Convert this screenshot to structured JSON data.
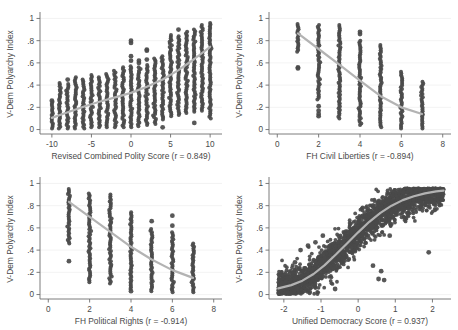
{
  "figure": {
    "title": "",
    "background": "#ffffff",
    "point_color": "#4a4a4a",
    "line_color": "#b3b3b3",
    "axis_color": "#6e6e6e",
    "grid_color": "#f0f0f0",
    "panel_count": 4
  },
  "chart_data": [
    {
      "type": "scatter",
      "panel": "top-left",
      "title": "",
      "xlabel": "Revised Combined Polity Score (r = 0.849)",
      "ylabel": "V-Dem Polyarchy Index",
      "correlation": 0.849,
      "xvar": "Revised Combined Polity Score",
      "yvar": "V-Dem Polyarchy Index",
      "xlim": [
        -11.5,
        11.5
      ],
      "ylim": [
        -0.04,
        1.04
      ],
      "xticks": [
        -10,
        -5,
        0,
        5,
        10
      ],
      "xticklabels": [
        "-10",
        "-5",
        "0",
        "5",
        "10"
      ],
      "yticks": [
        0,
        0.2,
        0.4,
        0.6,
        0.8,
        1
      ],
      "yticklabels": [
        "0",
        ".2",
        ".4",
        ".6",
        ".8",
        "1"
      ],
      "grid": "horizontal",
      "legend": "none",
      "columns": [
        {
          "x": -10,
          "ymin": 0.01,
          "ymax": 0.25,
          "n": 140,
          "outliers": [
            0.26
          ]
        },
        {
          "x": -9,
          "ymin": 0.01,
          "ymax": 0.42,
          "n": 110,
          "outliers": []
        },
        {
          "x": -8,
          "ymin": 0.01,
          "ymax": 0.41,
          "n": 120,
          "outliers": [
            0.45
          ]
        },
        {
          "x": -7,
          "ymin": 0.01,
          "ymax": 0.47,
          "n": 120,
          "outliers": []
        },
        {
          "x": -6,
          "ymin": 0.01,
          "ymax": 0.45,
          "n": 110,
          "outliers": []
        },
        {
          "x": -5,
          "ymin": 0.02,
          "ymax": 0.49,
          "n": 130,
          "outliers": []
        },
        {
          "x": -4,
          "ymin": 0.02,
          "ymax": 0.47,
          "n": 120,
          "outliers": []
        },
        {
          "x": -3,
          "ymin": 0.02,
          "ymax": 0.5,
          "n": 120,
          "outliers": []
        },
        {
          "x": -2,
          "ymin": 0.02,
          "ymax": 0.53,
          "n": 125,
          "outliers": []
        },
        {
          "x": -1,
          "ymin": 0.02,
          "ymax": 0.56,
          "n": 125,
          "outliers": []
        },
        {
          "x": 0,
          "ymin": 0.02,
          "ymax": 0.57,
          "n": 130,
          "outliers": [
            0.62,
            0.66,
            0.78,
            0.8
          ]
        },
        {
          "x": 1,
          "ymin": 0.03,
          "ymax": 0.56,
          "n": 130,
          "outliers": [
            0.6,
            0.62
          ]
        },
        {
          "x": 2,
          "ymin": 0.04,
          "ymax": 0.58,
          "n": 130,
          "outliers": [
            0.63,
            0.71,
            0.72
          ]
        },
        {
          "x": 3,
          "ymin": 0.05,
          "ymax": 0.64,
          "n": 130,
          "outliers": []
        },
        {
          "x": 4,
          "ymin": 0.09,
          "ymax": 0.66,
          "n": 125,
          "outliers": [
            0.02
          ]
        },
        {
          "x": 5,
          "ymin": 0.12,
          "ymax": 0.85,
          "n": 140,
          "outliers": []
        },
        {
          "x": 6,
          "ymin": 0.13,
          "ymax": 0.84,
          "n": 140,
          "outliers": [
            0.9
          ]
        },
        {
          "x": 7,
          "ymin": 0.15,
          "ymax": 0.88,
          "n": 140,
          "outliers": []
        },
        {
          "x": 8,
          "ymin": 0.16,
          "ymax": 0.9,
          "n": 145,
          "outliers": [
            0.06
          ]
        },
        {
          "x": 9,
          "ymin": 0.17,
          "ymax": 0.94,
          "n": 145,
          "outliers": []
        },
        {
          "x": 10,
          "ymin": 0.1,
          "ymax": 0.96,
          "n": 150,
          "outliers": []
        }
      ],
      "fit_line": [
        {
          "x": -10,
          "y": 0.105
        },
        {
          "x": -8,
          "y": 0.155
        },
        {
          "x": -6,
          "y": 0.205
        },
        {
          "x": -4,
          "y": 0.25
        },
        {
          "x": -2,
          "y": 0.29
        },
        {
          "x": 0,
          "y": 0.33
        },
        {
          "x": 2,
          "y": 0.385
        },
        {
          "x": 4,
          "y": 0.45
        },
        {
          "x": 6,
          "y": 0.535
        },
        {
          "x": 8,
          "y": 0.635
        },
        {
          "x": 10,
          "y": 0.745
        }
      ]
    },
    {
      "type": "scatter",
      "panel": "top-right",
      "title": "",
      "xlabel": "FH Civil Liberties (r = -0.894)",
      "ylabel": "V-Dem Polyarchy Index",
      "correlation": -0.894,
      "xvar": "FH Civil Liberties",
      "yvar": "V-Dem Polyarchy Index",
      "xlim": [
        -0.4,
        8.4
      ],
      "ylim": [
        -0.04,
        1.04
      ],
      "xticks": [
        0,
        2,
        4,
        6,
        8
      ],
      "xticklabels": [
        "0",
        "2",
        "4",
        "6",
        "8"
      ],
      "yticks": [
        0,
        0.2,
        0.4,
        0.6,
        0.8,
        1
      ],
      "yticklabels": [
        "0",
        ".2",
        ".4",
        ".6",
        ".8",
        "1"
      ],
      "grid": "horizontal",
      "legend": "none",
      "columns": [
        {
          "x": 1,
          "ymin": 0.7,
          "ymax": 0.95,
          "n": 170,
          "outliers": [
            0.55,
            0.56
          ]
        },
        {
          "x": 2,
          "ymin": 0.27,
          "ymax": 0.94,
          "n": 230,
          "outliers": [
            0.12,
            0.14,
            0.17,
            0.21
          ]
        },
        {
          "x": 3,
          "ymin": 0.1,
          "ymax": 0.94,
          "n": 230,
          "outliers": []
        },
        {
          "x": 4,
          "ymin": 0.04,
          "ymax": 0.8,
          "n": 230,
          "outliers": [
            0.86,
            0.88
          ]
        },
        {
          "x": 5,
          "ymin": 0.02,
          "ymax": 0.76,
          "n": 220,
          "outliers": []
        },
        {
          "x": 6,
          "ymin": 0.01,
          "ymax": 0.52,
          "n": 200,
          "outliers": []
        },
        {
          "x": 7,
          "ymin": 0.01,
          "ymax": 0.43,
          "n": 160,
          "outliers": []
        }
      ],
      "fit_line": [
        {
          "x": 1,
          "y": 0.865
        },
        {
          "x": 2,
          "y": 0.725
        },
        {
          "x": 3,
          "y": 0.585
        },
        {
          "x": 4,
          "y": 0.44
        },
        {
          "x": 5,
          "y": 0.3
        },
        {
          "x": 6,
          "y": 0.2
        },
        {
          "x": 7,
          "y": 0.14
        }
      ]
    },
    {
      "type": "scatter",
      "panel": "bottom-left",
      "title": "",
      "xlabel": "FH Political Rights (r = -0.914)",
      "ylabel": "V-Dem Polyarchy Index",
      "correlation": -0.914,
      "xvar": "FH Political Rights",
      "yvar": "V-Dem Polyarchy Index",
      "xlim": [
        -0.4,
        8.4
      ],
      "ylim": [
        -0.04,
        1.04
      ],
      "xticks": [
        0,
        2,
        4,
        6,
        8
      ],
      "xticklabels": [
        "0",
        "2",
        "4",
        "6",
        "8"
      ],
      "yticks": [
        0,
        0.2,
        0.4,
        0.6,
        0.8,
        1
      ],
      "yticklabels": [
        "0",
        ".2",
        ".4",
        ".6",
        ".8",
        "1"
      ],
      "grid": "horizontal",
      "legend": "none",
      "columns": [
        {
          "x": 1,
          "ymin": 0.46,
          "ymax": 0.95,
          "n": 210,
          "outliers": [
            0.3
          ]
        },
        {
          "x": 2,
          "ymin": 0.11,
          "ymax": 0.91,
          "n": 230,
          "outliers": []
        },
        {
          "x": 3,
          "ymin": 0.1,
          "ymax": 0.9,
          "n": 230,
          "outliers": []
        },
        {
          "x": 4,
          "ymin": 0.05,
          "ymax": 0.74,
          "n": 230,
          "outliers": [
            0.03
          ]
        },
        {
          "x": 5,
          "ymin": 0.03,
          "ymax": 0.59,
          "n": 220,
          "outliers": [
            0.66
          ]
        },
        {
          "x": 6,
          "ymin": 0.02,
          "ymax": 0.56,
          "n": 210,
          "outliers": [
            0.62,
            0.71
          ]
        },
        {
          "x": 7,
          "ymin": 0.02,
          "ymax": 0.46,
          "n": 180,
          "outliers": []
        }
      ],
      "fit_line": [
        {
          "x": 1,
          "y": 0.835
        },
        {
          "x": 2,
          "y": 0.7
        },
        {
          "x": 3,
          "y": 0.565
        },
        {
          "x": 4,
          "y": 0.43
        },
        {
          "x": 5,
          "y": 0.315
        },
        {
          "x": 6,
          "y": 0.22
        },
        {
          "x": 7,
          "y": 0.15
        }
      ]
    },
    {
      "type": "scatter",
      "panel": "bottom-right",
      "title": "",
      "xlabel": "Unified Democracy Score (r = 0.937)",
      "ylabel": "V-Dem Polyarchy Index",
      "correlation": 0.937,
      "xvar": "Unified Democracy Score",
      "yvar": "V-Dem Polyarchy Index",
      "xlim": [
        -2.4,
        2.5
      ],
      "ylim": [
        -0.04,
        1.04
      ],
      "xticks": [
        -2,
        -1,
        0,
        1,
        2
      ],
      "xticklabels": [
        "-2",
        "-1",
        "0",
        "1",
        "2"
      ],
      "yticks": [
        0,
        0.2,
        0.4,
        0.6,
        0.8,
        1
      ],
      "yticklabels": [
        "0",
        ".2",
        ".4",
        ".6",
        ".8",
        "1"
      ],
      "grid": "horizontal",
      "legend": "none",
      "cloud": {
        "n": 2400,
        "x_range": [
          -2.15,
          2.3
        ],
        "spread": 0.075,
        "description": "dense sigmoid-shaped band rising from y≈0.05 at x=-2 to y≈0.92 at x=2"
      },
      "scattered_outliers": [
        {
          "x": -1.55,
          "y": 0.4
        },
        {
          "x": -1.35,
          "y": 0.44
        },
        {
          "x": -1.15,
          "y": 0.47
        },
        {
          "x": -0.95,
          "y": 0.53
        },
        {
          "x": -1.7,
          "y": 0.29
        },
        {
          "x": -1.9,
          "y": 0.15
        },
        {
          "x": -2.05,
          "y": 0.1
        },
        {
          "x": 0.55,
          "y": 0.14
        },
        {
          "x": 0.7,
          "y": 0.13
        },
        {
          "x": 0.62,
          "y": 0.21
        },
        {
          "x": 0.4,
          "y": 0.26
        },
        {
          "x": 0.85,
          "y": 0.53
        },
        {
          "x": 1.9,
          "y": 0.38
        },
        {
          "x": -0.62,
          "y": 0.05
        }
      ],
      "fit_line": [
        {
          "x": -2.15,
          "y": 0.055
        },
        {
          "x": -1.8,
          "y": 0.085
        },
        {
          "x": -1.5,
          "y": 0.125
        },
        {
          "x": -1.2,
          "y": 0.185
        },
        {
          "x": -0.9,
          "y": 0.265
        },
        {
          "x": -0.6,
          "y": 0.36
        },
        {
          "x": -0.3,
          "y": 0.46
        },
        {
          "x": 0.0,
          "y": 0.56
        },
        {
          "x": 0.3,
          "y": 0.655
        },
        {
          "x": 0.6,
          "y": 0.735
        },
        {
          "x": 0.9,
          "y": 0.8
        },
        {
          "x": 1.2,
          "y": 0.85
        },
        {
          "x": 1.5,
          "y": 0.885
        },
        {
          "x": 1.8,
          "y": 0.91
        },
        {
          "x": 2.1,
          "y": 0.928
        },
        {
          "x": 2.3,
          "y": 0.935
        }
      ]
    }
  ]
}
